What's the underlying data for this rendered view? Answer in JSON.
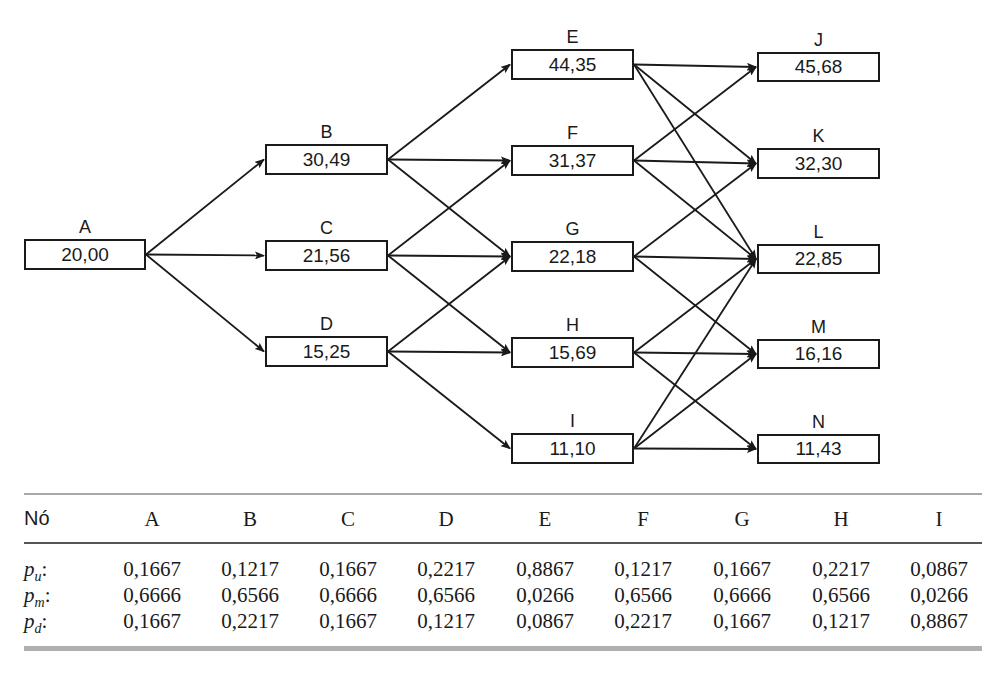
{
  "diagram": {
    "type": "trinomial-tree",
    "nodes": [
      {
        "id": "A",
        "label": "A",
        "value": "20,00",
        "x": 24,
        "y": 239,
        "w": 122,
        "h": 31
      },
      {
        "id": "B",
        "label": "B",
        "value": "30,49",
        "x": 265,
        "y": 144,
        "w": 123,
        "h": 31
      },
      {
        "id": "C",
        "label": "C",
        "value": "21,56",
        "x": 265,
        "y": 240,
        "w": 123,
        "h": 31
      },
      {
        "id": "D",
        "label": "D",
        "value": "15,25",
        "x": 265,
        "y": 336,
        "w": 123,
        "h": 31
      },
      {
        "id": "E",
        "label": "E",
        "value": "44,35",
        "x": 511,
        "y": 49,
        "w": 123,
        "h": 31
      },
      {
        "id": "F",
        "label": "F",
        "value": "31,37",
        "x": 511,
        "y": 145,
        "w": 123,
        "h": 31
      },
      {
        "id": "G",
        "label": "G",
        "value": "22,18",
        "x": 511,
        "y": 241,
        "w": 123,
        "h": 31
      },
      {
        "id": "H",
        "label": "H",
        "value": "15,69",
        "x": 511,
        "y": 337,
        "w": 123,
        "h": 31
      },
      {
        "id": "I",
        "label": "I",
        "value": "11,10",
        "x": 511,
        "y": 433,
        "w": 123,
        "h": 31
      },
      {
        "id": "J",
        "label": "J",
        "value": "45,68",
        "x": 757,
        "y": 52,
        "w": 123,
        "h": 30
      },
      {
        "id": "K",
        "label": "K",
        "value": "32,30",
        "x": 757,
        "y": 148,
        "w": 123,
        "h": 31
      },
      {
        "id": "L",
        "label": "L",
        "value": "22,85",
        "x": 757,
        "y": 244,
        "w": 123,
        "h": 30
      },
      {
        "id": "M",
        "label": "M",
        "value": "16,16",
        "x": 757,
        "y": 339,
        "w": 123,
        "h": 30
      },
      {
        "id": "N",
        "label": "N",
        "value": "11,43",
        "x": 757,
        "y": 434,
        "w": 123,
        "h": 30
      }
    ],
    "edges": [
      [
        "A",
        "B"
      ],
      [
        "A",
        "C"
      ],
      [
        "A",
        "D"
      ],
      [
        "B",
        "E"
      ],
      [
        "B",
        "F"
      ],
      [
        "B",
        "G"
      ],
      [
        "C",
        "F"
      ],
      [
        "C",
        "G"
      ],
      [
        "C",
        "H"
      ],
      [
        "D",
        "G"
      ],
      [
        "D",
        "H"
      ],
      [
        "D",
        "I"
      ],
      [
        "E",
        "J"
      ],
      [
        "E",
        "K"
      ],
      [
        "E",
        "L"
      ],
      [
        "F",
        "J"
      ],
      [
        "F",
        "K"
      ],
      [
        "F",
        "L"
      ],
      [
        "G",
        "K"
      ],
      [
        "G",
        "L"
      ],
      [
        "G",
        "M"
      ],
      [
        "H",
        "L"
      ],
      [
        "H",
        "M"
      ],
      [
        "H",
        "N"
      ],
      [
        "I",
        "L"
      ],
      [
        "I",
        "M"
      ],
      [
        "I",
        "N"
      ]
    ],
    "line_color": "#1a1a1a"
  },
  "table": {
    "header_label": "Nó",
    "columns": [
      "A",
      "B",
      "C",
      "D",
      "E",
      "F",
      "G",
      "H",
      "I"
    ],
    "rows": [
      {
        "symbol": "p",
        "subscript": "u",
        "suffix": ":",
        "values": [
          "0,1667",
          "0,1217",
          "0,1667",
          "0,2217",
          "0,8867",
          "0,1217",
          "0,1667",
          "0,2217",
          "0,0867"
        ]
      },
      {
        "symbol": "p",
        "subscript": "m",
        "suffix": ":",
        "values": [
          "0,6666",
          "0,6566",
          "0,6666",
          "0,6566",
          "0,0266",
          "0,6566",
          "0,6666",
          "0,6566",
          "0,0266"
        ]
      },
      {
        "symbol": "p",
        "subscript": "d",
        "suffix": ":",
        "values": [
          "0,1667",
          "0,2217",
          "0,1667",
          "0,1217",
          "0,0867",
          "0,2217",
          "0,1667",
          "0,1217",
          "0,8867"
        ]
      }
    ]
  }
}
